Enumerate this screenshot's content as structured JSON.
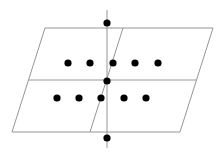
{
  "diagram": {
    "width": 223,
    "height": 157,
    "background": "#ffffff",
    "line_color": "#8a8a8a",
    "dot_color": "#000000",
    "dot_radius": 3.6,
    "parallelogram": {
      "top_left": [
        45,
        28
      ],
      "top_right": [
        213,
        28
      ],
      "bottom_right": [
        180,
        132
      ],
      "bottom_left": [
        12,
        132
      ]
    },
    "lines": [
      {
        "name": "middle-horizontal-line",
        "x1": 28.5,
        "y1": 80,
        "x2": 196.5,
        "y2": 80
      },
      {
        "name": "slanted-divider-line",
        "x1": 123,
        "y1": 28,
        "x2": 90,
        "y2": 132
      },
      {
        "name": "vertical-axis-line",
        "x1": 107,
        "y1": 10,
        "x2": 107,
        "y2": 148
      }
    ],
    "dots": [
      {
        "name": "axis-top-dot",
        "x": 107,
        "y": 23
      },
      {
        "name": "upper-row-dot-1",
        "x": 68,
        "y": 63
      },
      {
        "name": "upper-row-dot-2",
        "x": 90,
        "y": 63
      },
      {
        "name": "upper-row-dot-3",
        "x": 113,
        "y": 63
      },
      {
        "name": "upper-row-dot-4",
        "x": 135,
        "y": 63
      },
      {
        "name": "upper-row-dot-5",
        "x": 158,
        "y": 63
      },
      {
        "name": "center-dot",
        "x": 107,
        "y": 81
      },
      {
        "name": "lower-row-dot-1",
        "x": 57,
        "y": 98
      },
      {
        "name": "lower-row-dot-2",
        "x": 79,
        "y": 98
      },
      {
        "name": "lower-row-dot-3",
        "x": 101,
        "y": 98
      },
      {
        "name": "lower-row-dot-4",
        "x": 124,
        "y": 98
      },
      {
        "name": "lower-row-dot-5",
        "x": 146,
        "y": 98
      },
      {
        "name": "axis-bottom-dot",
        "x": 107,
        "y": 138
      }
    ]
  }
}
